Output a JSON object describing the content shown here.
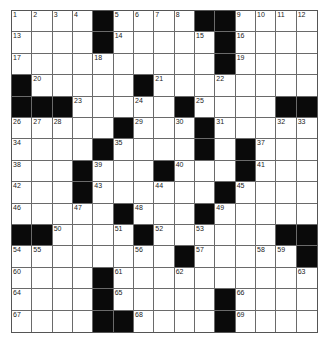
{
  "puzzle": {
    "rows": 15,
    "cols": 15,
    "colors": {
      "black": "#0a0a0a",
      "white": "#ffffff",
      "line": "#6a6a6a"
    },
    "grid": [
      "....#....##....",
      "....#.....#....",
      "..........#....",
      "#.....#........",
      "###.....#....##",
      ".....#...#.....",
      "....#....#.#...",
      "...#...#...#...",
      "...#......#....",
      ".....#...#.....",
      "##....#......##",
      "........#.....#",
      "....#..........",
      "....#.....#....",
      "....##....#...."
    ],
    "numbers": [
      {
        "r": 0,
        "c": 0,
        "n": "1"
      },
      {
        "r": 0,
        "c": 1,
        "n": "2"
      },
      {
        "r": 0,
        "c": 2,
        "n": "3"
      },
      {
        "r": 0,
        "c": 3,
        "n": "4"
      },
      {
        "r": 0,
        "c": 5,
        "n": "5"
      },
      {
        "r": 0,
        "c": 6,
        "n": "6"
      },
      {
        "r": 0,
        "c": 7,
        "n": "7"
      },
      {
        "r": 0,
        "c": 8,
        "n": "8"
      },
      {
        "r": 0,
        "c": 11,
        "n": "9"
      },
      {
        "r": 0,
        "c": 12,
        "n": "10"
      },
      {
        "r": 0,
        "c": 13,
        "n": "11"
      },
      {
        "r": 0,
        "c": 14,
        "n": "12"
      },
      {
        "r": 1,
        "c": 0,
        "n": "13"
      },
      {
        "r": 1,
        "c": 5,
        "n": "14"
      },
      {
        "r": 1,
        "c": 9,
        "n": "15"
      },
      {
        "r": 1,
        "c": 11,
        "n": "16"
      },
      {
        "r": 2,
        "c": 0,
        "n": "17"
      },
      {
        "r": 2,
        "c": 4,
        "n": "18"
      },
      {
        "r": 2,
        "c": 11,
        "n": "19"
      },
      {
        "r": 3,
        "c": 1,
        "n": "20"
      },
      {
        "r": 3,
        "c": 7,
        "n": "21"
      },
      {
        "r": 3,
        "c": 10,
        "n": "22"
      },
      {
        "r": 4,
        "c": 3,
        "n": "23"
      },
      {
        "r": 4,
        "c": 6,
        "n": "24"
      },
      {
        "r": 4,
        "c": 9,
        "n": "25"
      },
      {
        "r": 5,
        "c": 0,
        "n": "26"
      },
      {
        "r": 5,
        "c": 1,
        "n": "27"
      },
      {
        "r": 5,
        "c": 2,
        "n": "28"
      },
      {
        "r": 5,
        "c": 6,
        "n": "29"
      },
      {
        "r": 5,
        "c": 8,
        "n": "30"
      },
      {
        "r": 5,
        "c": 10,
        "n": "31"
      },
      {
        "r": 5,
        "c": 13,
        "n": "32"
      },
      {
        "r": 5,
        "c": 14,
        "n": "33"
      },
      {
        "r": 6,
        "c": 0,
        "n": "34"
      },
      {
        "r": 6,
        "c": 5,
        "n": "35"
      },
      {
        "r": 6,
        "c": 9,
        "n": "36"
      },
      {
        "r": 6,
        "c": 12,
        "n": "37"
      },
      {
        "r": 7,
        "c": 0,
        "n": "38"
      },
      {
        "r": 7,
        "c": 4,
        "n": "39"
      },
      {
        "r": 7,
        "c": 8,
        "n": "40"
      },
      {
        "r": 7,
        "c": 12,
        "n": "41"
      },
      {
        "r": 8,
        "c": 0,
        "n": "42"
      },
      {
        "r": 8,
        "c": 4,
        "n": "43"
      },
      {
        "r": 8,
        "c": 7,
        "n": "44"
      },
      {
        "r": 8,
        "c": 11,
        "n": "45"
      },
      {
        "r": 9,
        "c": 0,
        "n": "46"
      },
      {
        "r": 9,
        "c": 3,
        "n": "47"
      },
      {
        "r": 9,
        "c": 6,
        "n": "48"
      },
      {
        "r": 9,
        "c": 10,
        "n": "49"
      },
      {
        "r": 10,
        "c": 2,
        "n": "50"
      },
      {
        "r": 10,
        "c": 5,
        "n": "51"
      },
      {
        "r": 10,
        "c": 7,
        "n": "52"
      },
      {
        "r": 10,
        "c": 9,
        "n": "53"
      },
      {
        "r": 11,
        "c": 0,
        "n": "54"
      },
      {
        "r": 11,
        "c": 1,
        "n": "55"
      },
      {
        "r": 11,
        "c": 6,
        "n": "56"
      },
      {
        "r": 11,
        "c": 9,
        "n": "57"
      },
      {
        "r": 11,
        "c": 12,
        "n": "58"
      },
      {
        "r": 11,
        "c": 13,
        "n": "59"
      },
      {
        "r": 12,
        "c": 0,
        "n": "60"
      },
      {
        "r": 12,
        "c": 5,
        "n": "61"
      },
      {
        "r": 12,
        "c": 8,
        "n": "62"
      },
      {
        "r": 12,
        "c": 14,
        "n": "63"
      },
      {
        "r": 13,
        "c": 0,
        "n": "64"
      },
      {
        "r": 13,
        "c": 5,
        "n": "65"
      },
      {
        "r": 13,
        "c": 11,
        "n": "66"
      },
      {
        "r": 14,
        "c": 0,
        "n": "67"
      },
      {
        "r": 14,
        "c": 6,
        "n": "68"
      },
      {
        "r": 14,
        "c": 11,
        "n": "69"
      }
    ]
  }
}
